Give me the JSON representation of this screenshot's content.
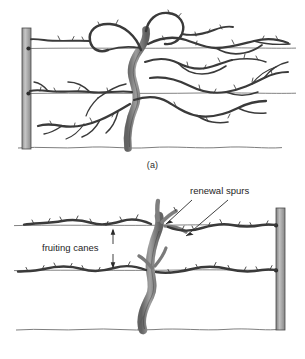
{
  "figure": {
    "background_color": "#ffffff",
    "width": 305,
    "height": 359
  },
  "panels": [
    {
      "id": "a",
      "caption": "(a)",
      "description": "Unpruned mature grapevine on a two-wire trellis with end post at left",
      "post_side": "left",
      "wire_count": 2,
      "labels": []
    },
    {
      "id": "b",
      "caption": "(b)",
      "description": "Same grapevine after pruning, showing fruiting canes tied along wires and short renewal spurs at the head",
      "post_side": "right",
      "wire_count": 2,
      "labels": [
        {
          "key": "renewal_spurs",
          "text": "renewal spurs",
          "x": 190,
          "y": 12
        },
        {
          "key": "fruiting_canes",
          "text": "fruiting canes",
          "x": 46,
          "y": 68
        }
      ]
    }
  ],
  "annotations": {
    "renewal_spurs_label": "renewal spurs",
    "fruiting_canes_label": "fruiting canes",
    "caption_a": "(a)",
    "caption_b": "(b)"
  },
  "colors": {
    "background": "#ffffff",
    "ink": "#1e1e1e",
    "vine_dark": "#3a3a3a",
    "vine_mid": "#6a6a6a",
    "trunk_fill": "#9a9a9a",
    "trunk_fill_light": "#bdbdbd",
    "post_fill": "#9b9b9b",
    "post_fill_light": "#c3c3c3",
    "post_edge": "#4a4a4a",
    "wire": "#5a5a5a",
    "ground": "#6f6f6f",
    "leader_line": "#2a2a2a"
  }
}
